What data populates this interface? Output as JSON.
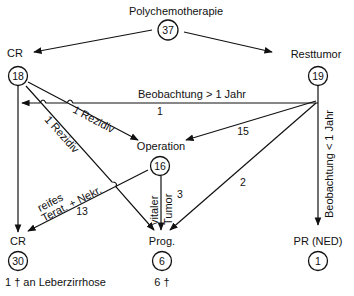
{
  "title": "Polychemotherapie",
  "nodes": {
    "start": {
      "label": "Polychemotherapie",
      "count": "37"
    },
    "cr_initial": {
      "label": "CR",
      "count": "18"
    },
    "resttumor": {
      "label": "Resttumor",
      "count": "19"
    },
    "operation": {
      "label": "Operation",
      "count": "16"
    },
    "cr_final": {
      "label": "CR",
      "count": "30",
      "note": "1 † an Leberzirrhose"
    },
    "prog": {
      "label": "Prog.",
      "count": "6",
      "note": "6 †"
    },
    "pr_ned": {
      "label": "PR (NED)",
      "count": "1"
    }
  },
  "edges": {
    "obs_gt_1yr": {
      "label": "Beobachtung > 1 Jahr",
      "value": "1"
    },
    "cr_rezidiv_op": {
      "label": "1 Rezidiv"
    },
    "cr_rezidiv_prog": {
      "label": "1 Rezidiv"
    },
    "rest_to_op": {
      "value": "15"
    },
    "rest_to_prog": {
      "value": "2"
    },
    "obs_lt_1yr": {
      "label": "Beobachtung < 1 Jahr"
    },
    "op_to_cr": {
      "label_line1": "reifes",
      "label_line2": "Terat. + Nekr.",
      "value": "13"
    },
    "op_to_prog": {
      "label_line1": "vitaler",
      "label_line2": "Tumor",
      "value": "3"
    }
  }
}
